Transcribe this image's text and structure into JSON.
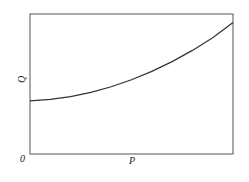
{
  "chart_data": {
    "type": "line",
    "title": "",
    "xlabel": "P",
    "ylabel": "Q",
    "origin_label": "0",
    "grid": false,
    "legend": null,
    "xlim": [
      0,
      1
    ],
    "ylim": [
      0,
      1
    ],
    "series": [
      {
        "name": "Q(P)",
        "x": [
          0,
          0.1,
          0.2,
          0.3,
          0.4,
          0.5,
          0.6,
          0.7,
          0.8,
          0.9,
          1.0
        ],
        "y": [
          0.38,
          0.39,
          0.41,
          0.44,
          0.48,
          0.53,
          0.59,
          0.66,
          0.74,
          0.83,
          0.94
        ]
      }
    ],
    "colors": {
      "axis": "#444444",
      "line": "#333333"
    }
  }
}
